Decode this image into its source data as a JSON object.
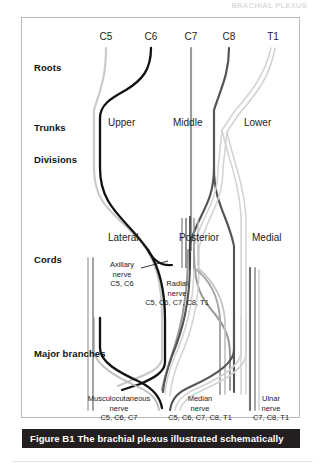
{
  "running_head": "BRACHIAL PLEXUS",
  "figure": {
    "caption_id": "Figure B1",
    "caption_text": "The brachial plexus illustrated schematically",
    "caption_bar_color": "#231f20",
    "caption_text_color": "#ffffff",
    "border_color": "#b9b9b9",
    "background_color": "#ffffff"
  },
  "row_labels": [
    {
      "id": "roots",
      "label": "Roots",
      "y": 49
    },
    {
      "id": "trunks",
      "label": "Trunks",
      "y": 109
    },
    {
      "id": "divisions",
      "label": "Divisions",
      "y": 141
    },
    {
      "id": "cords",
      "label": "Cords",
      "y": 241
    },
    {
      "id": "branches",
      "label": "Major branches",
      "y": 335
    }
  ],
  "roots": [
    {
      "label": "C5",
      "x": 84,
      "color": "#c9c9c9"
    },
    {
      "label": "C6",
      "x": 129,
      "color": "#121212"
    },
    {
      "label": "C7",
      "x": 169,
      "color": "#9a9a9a"
    },
    {
      "label": "C8",
      "x": 207,
      "color": "#545454"
    },
    {
      "label": "T1",
      "x": 251,
      "color": "#d2d2d2"
    }
  ],
  "trunks": [
    {
      "label": "Upper",
      "x": 86,
      "y": 105
    },
    {
      "label": "Middle",
      "x": 151,
      "y": 105
    },
    {
      "label": "Lower",
      "x": 222,
      "y": 105
    }
  ],
  "cords": [
    {
      "label": "Lateral",
      "x": 86,
      "y": 220
    },
    {
      "label": "Posterior",
      "x": 157,
      "y": 220
    },
    {
      "label": "Medial",
      "x": 230,
      "y": 220
    }
  ],
  "nerve_callouts": [
    {
      "id": "axillary",
      "name": "Axillary",
      "line2": "nerve",
      "roots": "C5, C6",
      "x": 100,
      "y": 250
    },
    {
      "id": "radial",
      "name": "Radial",
      "line2": "nerve",
      "roots": "C5, C6, C7, C8, T1",
      "x": 155,
      "y": 268
    }
  ],
  "major_branches": [
    {
      "id": "musculocutaneous",
      "name": "Musculocutaneous",
      "line2": "nerve",
      "roots": "C5, C6, C7",
      "x": 97,
      "y": 382
    },
    {
      "id": "median",
      "name": "Median",
      "line2": "nerve",
      "roots": "C5, C6, C7, C8, T1",
      "x": 178,
      "y": 382
    },
    {
      "id": "ulnar",
      "name": "Ulnar",
      "line2": "nerve",
      "roots": "C7, C8, T1",
      "x": 249,
      "y": 382
    }
  ]
}
